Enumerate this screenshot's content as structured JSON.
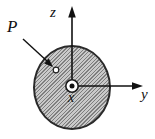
{
  "figure": {
    "labels": {
      "axis_z": "z",
      "axis_y": "y",
      "axis_x": "x",
      "point": "P"
    },
    "colors": {
      "background": "#ffffff",
      "disk_fill": "#c9c9c9",
      "disk_hatch": "#7e7e7e",
      "disk_outline": "#2a2a2a",
      "axis_stroke": "#111111",
      "marker_fill": "#ffffff",
      "origin_dot": "#111111"
    },
    "icons": {
      "origin_symbol": "out-of-page-axis-icon",
      "point_marker": "hollow-dot-icon"
    }
  }
}
